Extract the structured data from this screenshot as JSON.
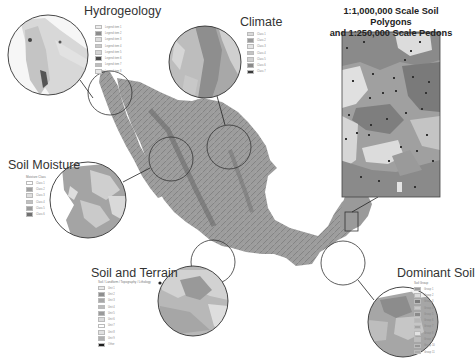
{
  "figure": {
    "panels": [
      {
        "id": "hydrogeology",
        "title": "Hydrogeology",
        "legend_header": "",
        "legend_swatches": [
          "#ececec",
          "#8c8c8c",
          "#dcdcdc",
          "#c8c8c8",
          "#d4d4d4",
          "#4a4a4a",
          "#bdbdbd",
          "#e6e6e6"
        ],
        "legend_labels": [
          "Legend item 1",
          "Legend item 2",
          "Legend item 3",
          "Legend item 4",
          "Legend item 5",
          "Legend item 6",
          "Legend item 7",
          "Legend item 8"
        ]
      },
      {
        "id": "climate",
        "title": "Climate",
        "legend_header": "",
        "legend_swatches": [
          "#dadada",
          "#9a9a9a",
          "#e4e4e4",
          "#c4c4c4",
          "#d0d0d0",
          "#8a8a8a",
          "#3a3a3a"
        ],
        "legend_labels": [
          "Class 1",
          "Class 2",
          "Class 3",
          "Class 4",
          "Class 5",
          "Class 6",
          "Class 7"
        ]
      },
      {
        "id": "soil-moisture",
        "title": "Soil Moisture",
        "legend_header": "Moisture Class",
        "legend_swatches": [
          "#ffffff",
          "#a0a0a0",
          "#dedede",
          "#c0c0c0",
          "#9c9c9c",
          "#707070"
        ],
        "legend_labels": [
          "Class 1",
          "Class 2",
          "Class 3",
          "Class 4",
          "Class 5",
          "Class 6"
        ]
      },
      {
        "id": "soil-and-terrain",
        "title": "Soil and Terrain",
        "legend_header": "Soil / Landform / Topography / Lithology",
        "legend_swatches": [
          "#e8e8e8",
          "#8e8e8e",
          "#a8a8a8",
          "#bcbcbc",
          "#9a9a9a",
          "#dcdcdc",
          "#ffffff",
          "#e0e0e0",
          "#b0b0b0",
          "#1e1e1e"
        ],
        "legend_labels": [
          "Unit 1",
          "Unit 2",
          "Unit 3",
          "Unit 4",
          "Unit 5",
          "Unit 6",
          "Unit 7",
          "Unit 8",
          "Unit 9",
          "Other"
        ]
      },
      {
        "id": "dominant-soil",
        "title": "Dominant Soil",
        "legend_header": "Soil Group",
        "legend_swatches": [
          "#9c9c9c",
          "#dadada",
          "#7c7c7c",
          "#c8c8c8",
          "#8a8a8a",
          "#b6b6b6",
          "#a4a4a4",
          "#e2e2e2",
          "#bcbcbc",
          "#969696",
          "#aaaaaa"
        ],
        "legend_labels": [
          "Group 1",
          "Group 2",
          "Group 3",
          "Group 4",
          "Group 5",
          "Group 6",
          "Group 7",
          "Group 8",
          "Group 9",
          "Group 10",
          "Group 11"
        ]
      }
    ],
    "inset": {
      "title_line1": "1:1,000,000  Scale Soil Polygons",
      "title_line2": "and 1:250,000 Scale Pedons"
    }
  }
}
